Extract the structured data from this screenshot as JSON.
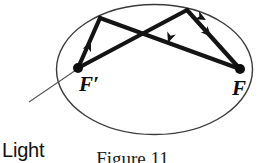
{
  "figure": {
    "type": "optics-diagram",
    "caption": "Figure 11",
    "labels": {
      "light_source_line1": "Light",
      "light_source_line2": "source",
      "focus_left": "F′",
      "focus_right": "F"
    },
    "colors": {
      "ink": "#0d0d0d",
      "ellipse_stroke": "#3a3a3a",
      "ray_stroke": "#141414",
      "leader_stroke": "#555555",
      "background": "#ffffff"
    },
    "ellipse": {
      "center_x": 154.5,
      "center_y": 69.5,
      "radius_x": 98,
      "radius_y": 65,
      "stroke_width": 1.4
    },
    "foci": [
      {
        "name": "focus-left",
        "label": "F′",
        "x": 78,
        "y": 68,
        "dot_radius": 5
      },
      {
        "name": "focus-right",
        "label": "F",
        "x": 240,
        "y": 69,
        "dot_radius": 5
      }
    ],
    "reflection_points": [
      {
        "name": "reflection-point-upper-left",
        "x": 100,
        "y": 18
      },
      {
        "name": "reflection-point-upper-right",
        "x": 187,
        "y": 10
      }
    ],
    "rays": [
      {
        "name": "ray-focus-left-to-upper-left",
        "from_x": 78,
        "from_y": 68,
        "to_x": 100,
        "to_y": 18,
        "arrow_at_x": 89,
        "arrow_at_y": 43,
        "direction": "up-left"
      },
      {
        "name": "ray-upper-left-to-focus-right",
        "from_x": 100,
        "from_y": 18,
        "to_x": 240,
        "to_y": 69,
        "arrow_at_x": 170,
        "arrow_at_y": 44,
        "direction": "down-right"
      },
      {
        "name": "ray-focus-left-to-upper-right",
        "from_x": 78,
        "from_y": 68,
        "to_x": 187,
        "to_y": 10,
        "arrow_at_x": 132,
        "arrow_at_y": 39,
        "direction": "up-right"
      },
      {
        "name": "ray-upper-right-to-focus-right",
        "from_x": 187,
        "from_y": 10,
        "to_x": 240,
        "to_y": 69,
        "arrow_at_x": 213,
        "arrow_at_y": 39,
        "direction": "down-right"
      }
    ],
    "leader_line": {
      "name": "light-source-leader",
      "from_x": 29,
      "from_y": 102,
      "to_x": 76,
      "to_y": 70,
      "stroke_width": 1.1
    }
  }
}
